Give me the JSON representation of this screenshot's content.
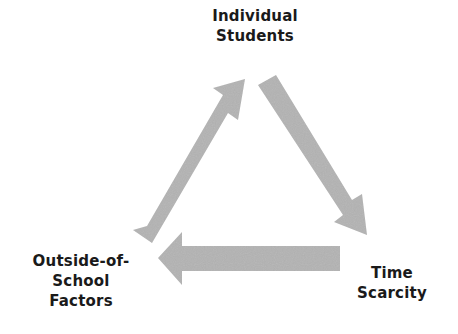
{
  "diagram": {
    "type": "cycle",
    "nodes": [
      {
        "id": "top",
        "lines": [
          "Individual",
          "Students"
        ]
      },
      {
        "id": "right",
        "lines": [
          "Time",
          "Scarcity"
        ]
      },
      {
        "id": "left",
        "lines": [
          "Outside-of-",
          "School",
          "Factors"
        ]
      }
    ],
    "edges": [
      {
        "from": "left",
        "to": "top"
      },
      {
        "from": "top",
        "to": "right"
      },
      {
        "from": "right",
        "to": "left"
      }
    ],
    "colors": {
      "arrow": "#b3b3b3",
      "text": "#1a1a1a",
      "background": "#ffffff"
    }
  }
}
